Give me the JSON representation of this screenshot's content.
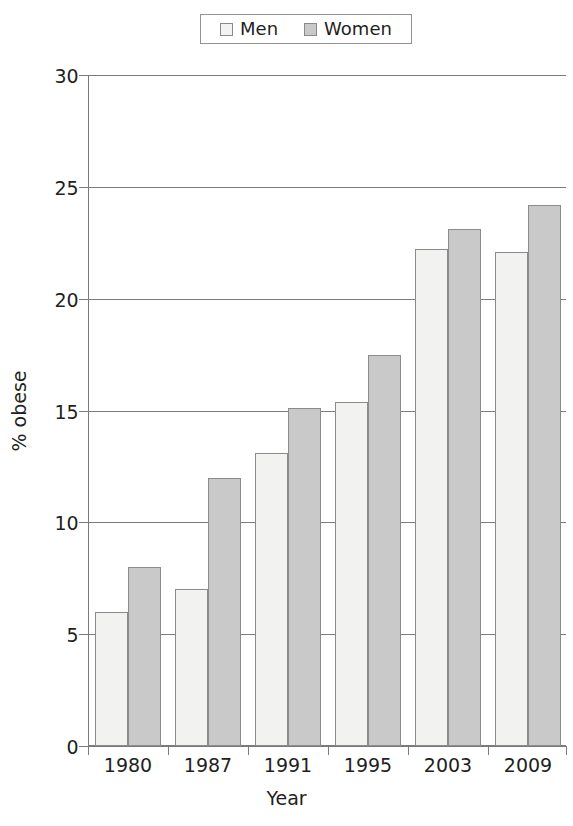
{
  "legend": {
    "position": "top-center",
    "entries": [
      {
        "label": "Men",
        "swatch": "men-swatch",
        "color": "#f2f2f0"
      },
      {
        "label": "Women",
        "swatch": "women-swatch",
        "color": "#c9c9c9"
      }
    ]
  },
  "axes": {
    "ylabel": "% obese",
    "xlabel": "Year",
    "yticks": [
      "0",
      "5",
      "10",
      "15",
      "20",
      "25",
      "30"
    ]
  },
  "chart_data": {
    "type": "bar",
    "title": "",
    "xlabel": "Year",
    "ylabel": "% obese",
    "categories": [
      "1980",
      "1987",
      "1991",
      "1995",
      "2003",
      "2009"
    ],
    "series": [
      {
        "name": "Men",
        "color": "#f2f2f0",
        "values": [
          6.0,
          7.0,
          13.1,
          15.4,
          22.2,
          22.1
        ]
      },
      {
        "name": "Women",
        "color": "#c9c9c9",
        "values": [
          8.0,
          12.0,
          15.1,
          17.5,
          23.1,
          24.2
        ]
      }
    ],
    "ylim": [
      0,
      30
    ],
    "ytick_values": [
      0,
      5,
      10,
      15,
      20,
      25,
      30
    ],
    "grid": "horizontal",
    "legend_position": "top-center"
  }
}
